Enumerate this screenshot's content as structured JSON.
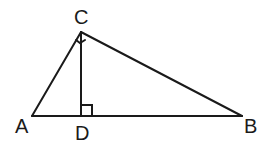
{
  "diagram": {
    "type": "right-triangle-with-altitude",
    "points": {
      "A": {
        "label": "A",
        "x": 32,
        "y": 116
      },
      "B": {
        "label": "B",
        "x": 242,
        "y": 116
      },
      "C": {
        "label": "C",
        "x": 81,
        "y": 32
      },
      "D": {
        "label": "D",
        "x": 81,
        "y": 116
      }
    },
    "segments": [
      "AC",
      "CB",
      "AB",
      "CD"
    ],
    "right_angles": [
      "ACB",
      "CDB"
    ],
    "stroke_color": "#1a1a1a"
  }
}
